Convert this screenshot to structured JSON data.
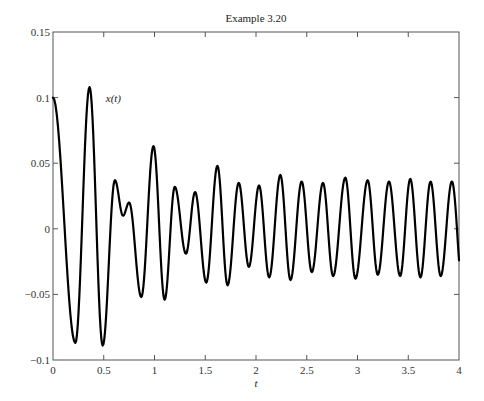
{
  "chart_data": {
    "type": "line",
    "title": "Example 3.20",
    "xlabel": "t",
    "ylabel": "",
    "xlim": [
      0,
      4
    ],
    "ylim": [
      -0.1,
      0.15
    ],
    "xticks": [
      0,
      0.5,
      1,
      1.5,
      2,
      2.5,
      3,
      3.5,
      4
    ],
    "xtick_labels": [
      "0",
      "0.5",
      "1",
      "1.5",
      "2",
      "2.5",
      "3",
      "3.5",
      "4"
    ],
    "yticks": [
      -0.1,
      -0.05,
      0,
      0.05,
      0.1,
      0.15
    ],
    "ytick_labels": [
      "-0.1",
      "-0.05",
      "0",
      "0.05",
      "0.1",
      "0.15"
    ],
    "grid": false,
    "legend": null,
    "annotations": [
      {
        "text": "x(t)",
        "x": 0.52,
        "y": 0.097
      }
    ],
    "series": [
      {
        "name": "x(t)",
        "color": "#000000",
        "description": "Damped oscillation settling into a steady sinusoid of amplitude ~0.037 (extrema points)",
        "x": [
          0.0,
          0.22,
          0.36,
          0.49,
          0.61,
          0.69,
          0.75,
          0.87,
          0.99,
          1.1,
          1.2,
          1.31,
          1.4,
          1.51,
          1.62,
          1.72,
          1.83,
          1.93,
          2.03,
          2.13,
          2.24,
          2.34,
          2.45,
          2.55,
          2.66,
          2.76,
          2.88,
          2.98,
          3.1,
          3.2,
          3.31,
          3.42,
          3.52,
          3.62,
          3.72,
          3.82,
          3.93,
          4.0
        ],
        "y": [
          0.1,
          -0.087,
          0.108,
          -0.089,
          0.037,
          0.01,
          0.02,
          -0.052,
          0.063,
          -0.054,
          0.032,
          -0.019,
          0.028,
          -0.041,
          0.048,
          -0.043,
          0.035,
          -0.029,
          0.033,
          -0.037,
          0.041,
          -0.039,
          0.036,
          -0.033,
          0.035,
          -0.036,
          0.039,
          -0.038,
          0.037,
          -0.035,
          0.036,
          -0.036,
          0.038,
          -0.037,
          0.036,
          -0.036,
          0.036,
          -0.024
        ]
      }
    ]
  }
}
